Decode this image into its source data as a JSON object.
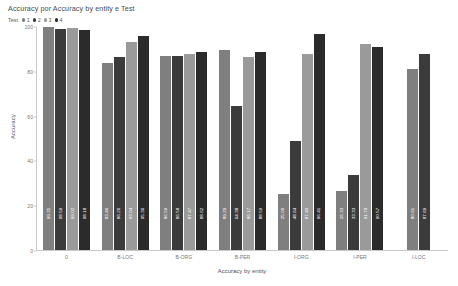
{
  "chart_data": {
    "type": "bar",
    "title": "Accuracy por Accuracy by entity e Test",
    "xlabel": "Accuracy by entity",
    "ylabel": "Accuracy",
    "ylim": [
      0,
      100
    ],
    "yticks": [
      "0",
      "20",
      "40",
      "60",
      "80",
      "100"
    ],
    "grid": false,
    "legend": {
      "title": "Test",
      "position": "top-left",
      "entries": [
        {
          "label": "1",
          "color": "#7f7f7f"
        },
        {
          "label": "2",
          "color": "#3b3b3b"
        },
        {
          "label": "3",
          "color": "#9a9a9a"
        },
        {
          "label": "4",
          "color": "#2b2b2b"
        }
      ]
    },
    "categories": [
      "0",
      "B-LOC",
      "B-ORG",
      "B-PER",
      "I-ORG",
      "I-PER",
      "I-LOC"
    ],
    "series": [
      {
        "name": "1",
        "color": "#7f7f7f",
        "values": [
          99.35,
          83.46,
          86.59,
          89.29,
          25.0,
          26.33,
          80.61
        ]
      },
      {
        "name": "2",
        "color": "#3b3b3b",
        "values": [
          98.59,
          86.26,
          86.58,
          64.38,
          48.64,
          33.33,
          87.69
        ]
      },
      {
        "name": "3",
        "color": "#9a9a9a",
        "values": [
          99.02,
          93.04,
          87.47,
          86.17,
          87.4,
          91.78,
          null
        ]
      },
      {
        "name": "4",
        "color": "#2b2b2b",
        "values": [
          98.18,
          95.36,
          88.62,
          88.5,
          96.41,
          90.57,
          null
        ]
      }
    ],
    "bar_labels": [
      {
        "category": "0",
        "labels": [
          "99.35",
          "98.59",
          "99.02",
          "98.18"
        ]
      },
      {
        "category": "B-LOC",
        "labels": [
          "83.46",
          "86.26",
          "93.04",
          "95.36"
        ]
      },
      {
        "category": "B-ORG",
        "labels": [
          "86.59",
          "86.58",
          "87.47",
          "88.62"
        ]
      },
      {
        "category": "B-PER",
        "labels": [
          "89.29",
          "64.38",
          "86.17",
          "88.50"
        ]
      },
      {
        "category": "I-ORG",
        "labels": [
          "25.00",
          "48.64",
          "87.40",
          "96.41"
        ]
      },
      {
        "category": "I-PER",
        "labels": [
          "26.33",
          "33.33",
          "91.78",
          "90.57"
        ]
      },
      {
        "category": "I-LOC",
        "labels": [
          "80.61",
          "87.69"
        ]
      }
    ]
  }
}
